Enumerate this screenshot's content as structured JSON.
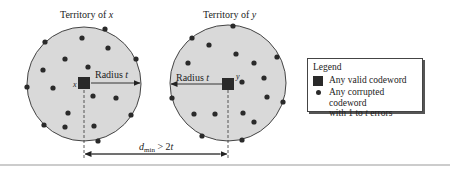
{
  "diagram": {
    "territory_x": {
      "title_prefix": "Territory of ",
      "title_var": "x",
      "codeword_label": "x",
      "radius_label_prefix": "Radius ",
      "radius_label_var": "t",
      "center": [
        84,
        84
      ],
      "radius": 57,
      "dots": [
        [
          105,
          29
        ],
        [
          45,
          42
        ],
        [
          82,
          38
        ],
        [
          108,
          48
        ],
        [
          136,
          59
        ],
        [
          65,
          59
        ],
        [
          88,
          67
        ],
        [
          43,
          70
        ],
        [
          27,
          87
        ],
        [
          53,
          88
        ],
        [
          93,
          96
        ],
        [
          116,
          98
        ],
        [
          68,
          113
        ],
        [
          131,
          115
        ],
        [
          44,
          125
        ],
        [
          65,
          127
        ],
        [
          94,
          126
        ],
        [
          98,
          141
        ]
      ]
    },
    "territory_y": {
      "title_prefix": "Territory of ",
      "title_var": "y",
      "codeword_label": "y",
      "radius_label_prefix": "Radius ",
      "radius_label_var": "t",
      "center": [
        228,
        83
      ],
      "radius": 58,
      "dots": [
        [
          233,
          26
        ],
        [
          192,
          38
        ],
        [
          209,
          45
        ],
        [
          236,
          54
        ],
        [
          188,
          63
        ],
        [
          254,
          63
        ],
        [
          277,
          57
        ],
        [
          264,
          78
        ],
        [
          242,
          82
        ],
        [
          267,
          97
        ],
        [
          172,
          98
        ],
        [
          283,
          102
        ],
        [
          194,
          114
        ],
        [
          215,
          114
        ],
        [
          243,
          113
        ],
        [
          254,
          122
        ],
        [
          202,
          136
        ],
        [
          242,
          140
        ]
      ]
    },
    "distance": {
      "label_d": "d",
      "label_sub": "min",
      "label_rest": " > 2",
      "label_var": "t"
    },
    "colors": {
      "territory_fill": "#d9d9d9",
      "outline": "#444444",
      "codeword": "#2a2a2a",
      "rule": "#999999"
    }
  },
  "legend": {
    "title": "Legend",
    "items": [
      {
        "icon": "square-icon",
        "label": "Any valid codeword"
      },
      {
        "icon": "dot-icon",
        "label_line1": "Any corrupted codeword",
        "label_line2_prefix": "with 1 to ",
        "label_line2_var": "t",
        "label_line2_suffix": " errors"
      }
    ]
  }
}
